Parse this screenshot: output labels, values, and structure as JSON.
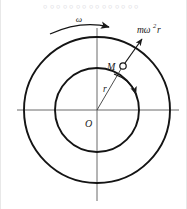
{
  "figure": {
    "title_strip_text": "。。。。。。。。。。。。。。。",
    "type": "mechanics-diagram",
    "background_color": "#ffffff",
    "line_color": "#1a1a1a",
    "axis_color": "#4a4a4a"
  },
  "geometry": {
    "center_x": 96,
    "center_y": 110,
    "outer_radius": 73,
    "inner_radius": 42,
    "point_m_x": 122,
    "point_m_y": 66,
    "marker_radius": 3.2,
    "axis_h_x1": 16,
    "axis_h_x2": 178,
    "axis_v_y1": 28,
    "axis_v_y2": 201
  },
  "labels": {
    "angular_velocity": "ω",
    "force_base": "mω",
    "force_exponent": "2",
    "force_tail": "r",
    "force_full": "mω²r",
    "point_mass": "M",
    "radius": "r",
    "origin": "O"
  },
  "label_positions": {
    "angular_velocity": {
      "x": 78,
      "y": 22
    },
    "force": {
      "x": 140,
      "y": 32
    },
    "point_mass": {
      "x": 107,
      "y": 70
    },
    "radius": {
      "x": 103,
      "y": 91
    },
    "origin": {
      "x": 86,
      "y": 126
    }
  },
  "arrows": {
    "omega_arc": {
      "name": "angular-velocity-arc-arrow",
      "path": "M 49 33 Q 80 21 110 27",
      "direction": "clockwise-right"
    },
    "force_arrow": {
      "name": "centrifugal-force-arrow",
      "path": "M 121 68 L 143 38",
      "direction": "outward-radial"
    },
    "tangent_arc": {
      "name": "tangential-velocity-arc-arrow",
      "path": "M 114 73 Q 131 79 136 93",
      "direction": "tangential"
    }
  }
}
